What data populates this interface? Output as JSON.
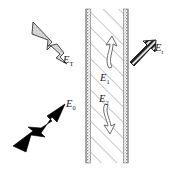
{
  "figure": {
    "type": "optics-slab-diagram",
    "background_color": "#ffffff"
  },
  "slab": {
    "name": "dielectric-slab",
    "fill_pattern": "diagonal-hatch",
    "hatch_color": "#9a9a9a",
    "border_color": "#777777",
    "edge_texture": "stippled-vertical-band",
    "x_left": 86,
    "x_right": 128,
    "y_top": 9,
    "y_bottom": 163
  },
  "arrows": [
    {
      "id": "incident",
      "label": "E",
      "subscript": "0",
      "style": "solid-black",
      "fill": "#000000",
      "direction": "up-right",
      "label_x": 66,
      "label_y": 107
    },
    {
      "id": "reflected",
      "label": "E",
      "subscript": "T",
      "style": "stippled-gray-outline",
      "fill": "#d6d6d6",
      "direction": "up-left",
      "label_x": 63,
      "label_y": 63
    },
    {
      "id": "internal-upper",
      "label": "E",
      "subscript": "1",
      "style": "white-outline-curved",
      "fill": "#ffffff",
      "direction": "up",
      "label_x": 101,
      "label_y": 80
    },
    {
      "id": "internal-lower",
      "label": "E",
      "subscript": "2",
      "style": "white-outline-curved",
      "fill": "#ffffff",
      "direction": "down",
      "label_x": 101,
      "label_y": 101
    },
    {
      "id": "transmitted",
      "label": "E",
      "subscript": "t",
      "style": "striped-hatched",
      "fill": "#2b2b2b",
      "direction": "up-right",
      "label_x": 154,
      "label_y": 50
    }
  ],
  "labels": {
    "incident": "E",
    "incident_sub": "0",
    "reflected": "E",
    "reflected_sub": "T",
    "internal_upper": "E",
    "internal_upper_sub": "1",
    "internal_lower": "E",
    "internal_lower_sub": "2",
    "transmitted": "E",
    "transmitted_sub": "t"
  }
}
